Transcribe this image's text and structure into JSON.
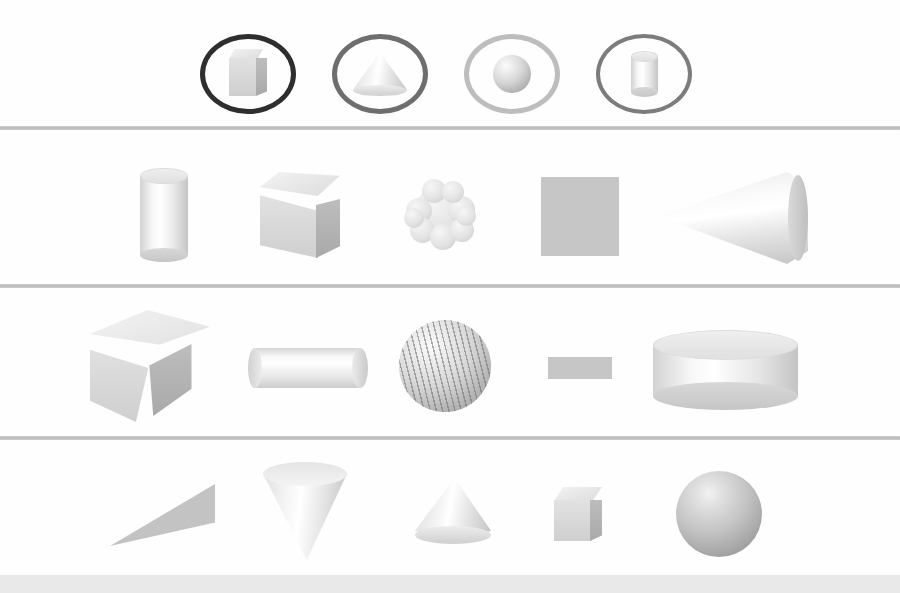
{
  "figure": {
    "background_color": "#fefefe",
    "divider_color": "#b6b6b6",
    "footer_bar_color": "#e9e9ea",
    "width": 900,
    "height": 593
  },
  "legend": {
    "label": "Shape category icons",
    "items": [
      {
        "id": "cube",
        "icon": "cube-icon",
        "label": "Cube",
        "ring_color": "#2e2e2e",
        "ring_weight": "heavy"
      },
      {
        "id": "cone",
        "icon": "cone-icon",
        "label": "Cone",
        "ring_color": "#6e6e6e",
        "ring_weight": "medium"
      },
      {
        "id": "sphere",
        "icon": "sphere-icon",
        "label": "Sphere",
        "ring_color": "#bdbdbd",
        "ring_weight": "light"
      },
      {
        "id": "cylinder",
        "icon": "cylinder-icon",
        "label": "Cylinder",
        "ring_color": "#7c7c7c",
        "ring_weight": "medium"
      }
    ]
  },
  "rows": [
    {
      "index": 1,
      "label": "Row 1",
      "shapes": [
        {
          "name": "tall-cylinder",
          "category": "cylinder",
          "render": "shaded",
          "orientation": "upright"
        },
        {
          "name": "cube",
          "category": "cube",
          "render": "shaded",
          "orientation": "three-quarter"
        },
        {
          "name": "bumpy-sphere",
          "category": "sphere",
          "render": "bumpy",
          "orientation": "upright"
        },
        {
          "name": "flat-square",
          "category": "cube",
          "render": "silhouette",
          "orientation": "face-on"
        },
        {
          "name": "sideways-cone",
          "category": "cone",
          "render": "shaded",
          "orientation": "horizontal"
        }
      ]
    },
    {
      "index": 2,
      "label": "Row 2",
      "shapes": [
        {
          "name": "rotated-cube",
          "category": "cube",
          "render": "shaded",
          "orientation": "tilted"
        },
        {
          "name": "horizontal-cylinder",
          "category": "cylinder",
          "render": "shaded",
          "orientation": "horizontal"
        },
        {
          "name": "striped-sphere",
          "category": "sphere",
          "render": "textured",
          "orientation": "upright"
        },
        {
          "name": "flat-rectangle",
          "category": "cylinder",
          "render": "silhouette",
          "orientation": "edge-on"
        },
        {
          "name": "wide-short-cylinder",
          "category": "cylinder",
          "render": "shaded",
          "orientation": "upright"
        }
      ]
    },
    {
      "index": 3,
      "label": "Row 3",
      "shapes": [
        {
          "name": "flat-triangle",
          "category": "cone",
          "render": "silhouette",
          "orientation": "edge-on"
        },
        {
          "name": "inverted-cone",
          "category": "cone",
          "render": "shaded",
          "orientation": "point-down"
        },
        {
          "name": "squat-cone",
          "category": "cone",
          "render": "shaded",
          "orientation": "point-up"
        },
        {
          "name": "textured-cube",
          "category": "cube",
          "render": "textured",
          "orientation": "three-quarter"
        },
        {
          "name": "shaded-sphere",
          "category": "sphere",
          "render": "shaded",
          "orientation": "upright"
        }
      ]
    }
  ]
}
